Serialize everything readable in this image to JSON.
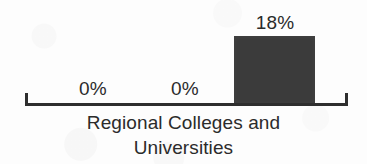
{
  "figure": {
    "background_color": "#fdfdfd",
    "ink_color": "#2e2e2e",
    "bar_color": "#3b3b3b"
  },
  "axis": {
    "left_tick_name": "axis-tick-left",
    "right_tick_name": "axis-tick-right"
  },
  "caption": {
    "line1": "Regional Colleges and",
    "line2": "Universities"
  },
  "chart_data": {
    "type": "bar",
    "title": "",
    "subtitle": "",
    "xlabel": "Regional Colleges and Universities",
    "ylabel": "",
    "categories": [
      "",
      "",
      ""
    ],
    "values": [
      0,
      0,
      18
    ],
    "value_labels": [
      "0%",
      "0%",
      "18%"
    ],
    "units": "percent",
    "ylim": [
      0,
      18
    ],
    "grid": false,
    "legend": false
  }
}
